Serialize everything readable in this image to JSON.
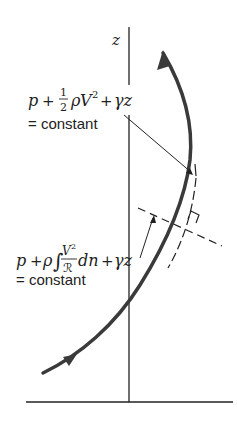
{
  "figure": {
    "axis_label": "z",
    "equation_top": {
      "p": "p",
      "plus1": "+",
      "frac_num": "1",
      "frac_den": "2",
      "rho": "ρ",
      "V": "V",
      "exp": "2",
      "plus2": "+",
      "gamma_z": "γz",
      "result": "= constant"
    },
    "equation_bottom": {
      "p": "p",
      "plus1": "+",
      "rho": "ρ",
      "integral": "∫",
      "frac_num": "V",
      "frac_num_exp": "2",
      "frac_den": "ℛ",
      "dn": "dn",
      "plus2": "+",
      "gamma_z": "γz",
      "result": "= constant"
    },
    "colors": {
      "streamline": "#3a3a3a",
      "lines": "#222222"
    }
  }
}
